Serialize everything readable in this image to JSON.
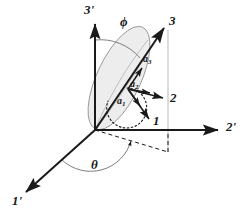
{
  "figure": {
    "type": "3d-coordinate-axes-diagram",
    "title": "",
    "background_color": "#ffffff",
    "line_color": "#1a1a1a",
    "thin_line_color": "#8a8a8a",
    "ellipse_fill_color": "#ededed",
    "ellipse_stroke_color": "#7a7a7a",
    "width": 248,
    "height": 217,
    "origin": {
      "x": 95,
      "y": 130
    }
  },
  "axes": {
    "primed": [
      {
        "name": "axis-3-prime",
        "label": "3'",
        "label_x": 84,
        "label_y": 5,
        "from": {
          "x": 95,
          "y": 130
        },
        "to": {
          "x": 95,
          "y": 22
        },
        "arrow": true,
        "style": "solid"
      },
      {
        "name": "axis-2-prime",
        "label": "2'",
        "label_x": 228,
        "label_y": 122,
        "from": {
          "x": 95,
          "y": 130
        },
        "to": {
          "x": 222,
          "y": 130
        },
        "arrow": true,
        "style": "solid"
      },
      {
        "name": "axis-1-prime",
        "label": "1'",
        "label_x": 13,
        "label_y": 197,
        "from": {
          "x": 95,
          "y": 130
        },
        "to": {
          "x": 24,
          "y": 194
        },
        "arrow": true,
        "style": "solid"
      }
    ],
    "unprimed": [
      {
        "name": "axis-3",
        "label": "3",
        "label_x": 170,
        "label_y": 17,
        "from": {
          "x": 95,
          "y": 130
        },
        "to": {
          "x": 165,
          "y": 27
        },
        "arrow": true,
        "style": "solid"
      },
      {
        "name": "axis-2",
        "label": "2",
        "label_x": 172,
        "label_y": 93,
        "from": {
          "x": 128,
          "y": 89
        },
        "to": {
          "x": 166,
          "y": 99
        },
        "arrow": true,
        "style": "solid"
      },
      {
        "name": "axis-1",
        "label": "1",
        "label_x": 155,
        "label_y": 117,
        "from": {
          "x": 128,
          "y": 89
        },
        "to": {
          "x": 151,
          "y": 121
        },
        "arrow": true,
        "style": "solid"
      }
    ]
  },
  "vectors": [
    {
      "name": "vector-a3",
      "label": "a",
      "subscript": "3",
      "label_x": 144,
      "label_y": 57,
      "from": {
        "x": 128,
        "y": 89
      },
      "to": {
        "x": 143,
        "y": 67
      }
    },
    {
      "name": "vector-a2",
      "label": "a",
      "subscript": "2",
      "label_x": 131,
      "label_y": 82,
      "from": {
        "x": 128,
        "y": 89
      },
      "to": {
        "x": 152,
        "y": 94
      }
    },
    {
      "name": "vector-a1",
      "label": "a",
      "subscript": "1",
      "label_x": 118,
      "label_y": 99,
      "from": {
        "x": 128,
        "y": 89
      },
      "to": {
        "x": 142,
        "y": 108
      }
    }
  ],
  "angles": [
    {
      "name": "angle-phi",
      "label": "ϕ",
      "label_x": 122,
      "label_y": 19,
      "description": "polar angle between 3-prime axis and 3 axis",
      "arc_style": "thin-solid"
    },
    {
      "name": "angle-theta",
      "label": "θ",
      "label_x": 92,
      "label_y": 160,
      "description": "azimuthal angle between 1-prime axis and projection of 3 axis",
      "arc_style": "thin-solid"
    },
    {
      "name": "angle-spin-arc",
      "label": "",
      "description": "dotted arc near body axes indicating spin angle",
      "arc_style": "dotted"
    }
  ],
  "guides": [
    {
      "name": "projection-dashed-line",
      "style": "dashed",
      "description": "dashed projection from origin to foot of perpendicular"
    },
    {
      "name": "vertical-guide-line",
      "style": "thin-solid",
      "description": "thin vertical line from 3 axis down to projection point"
    },
    {
      "name": "ellipse-disk",
      "style": "filled-ellipse",
      "description": "shaded elliptical disk tilted along the 3 axis"
    }
  ]
}
